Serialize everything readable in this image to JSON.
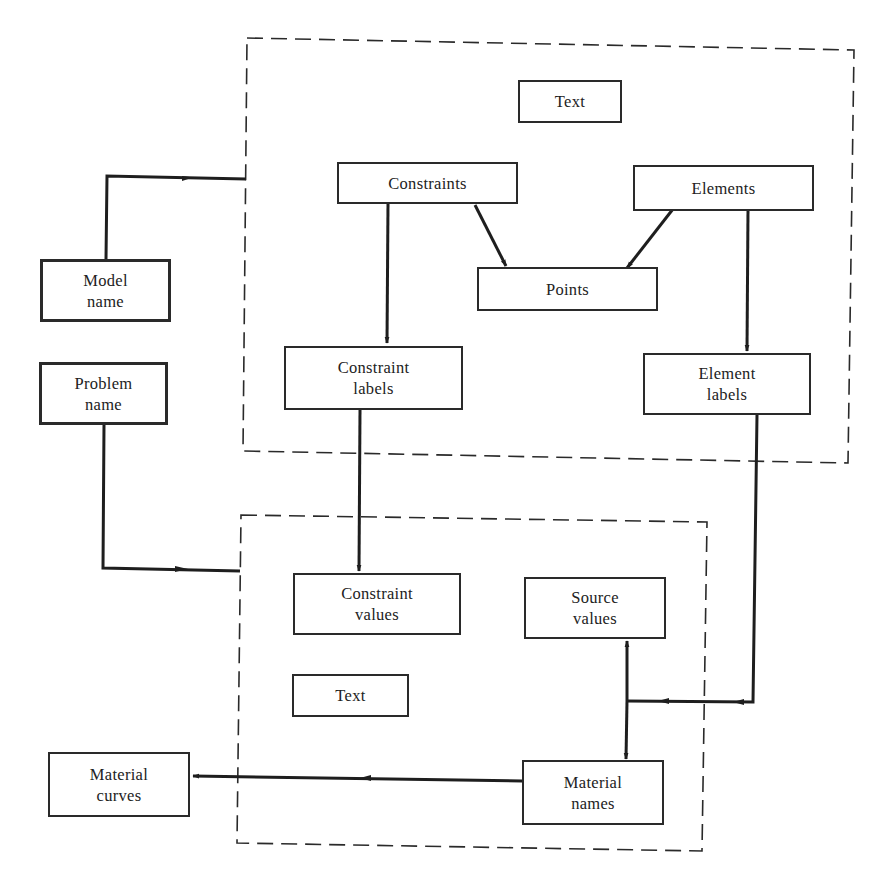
{
  "diagram": {
    "groups": [
      {
        "id": "upper-group",
        "style": "dashed"
      },
      {
        "id": "lower-group",
        "style": "dashed"
      }
    ],
    "nodes": {
      "text_upper": {
        "lines": [
          "Text"
        ]
      },
      "constraints": {
        "lines": [
          "Constraints"
        ]
      },
      "elements": {
        "lines": [
          "Elements"
        ]
      },
      "points": {
        "lines": [
          "Points"
        ]
      },
      "constraint_labels": {
        "lines": [
          "Constraint",
          "labels"
        ]
      },
      "element_labels": {
        "lines": [
          "Element",
          "labels"
        ]
      },
      "model_name": {
        "lines": [
          "Model",
          "name"
        ]
      },
      "problem_name": {
        "lines": [
          "Problem",
          "name"
        ]
      },
      "constraint_values": {
        "lines": [
          "Constraint",
          "values"
        ]
      },
      "text_lower": {
        "lines": [
          "Text"
        ]
      },
      "source_values": {
        "lines": [
          "Source",
          "values"
        ]
      },
      "material_names": {
        "lines": [
          "Material",
          "names"
        ]
      },
      "material_curves": {
        "lines": [
          "Material",
          "curves"
        ]
      }
    },
    "edges": [
      {
        "from": "Model name",
        "to": "upper-group"
      },
      {
        "from": "Problem name",
        "to": "lower-group"
      },
      {
        "from": "Constraints",
        "to": "Points"
      },
      {
        "from": "Elements",
        "to": "Points"
      },
      {
        "from": "Constraints",
        "to": "Constraint labels"
      },
      {
        "from": "Elements",
        "to": "Element labels"
      },
      {
        "from": "Constraint labels",
        "to": "Constraint values"
      },
      {
        "from": "Element labels",
        "to": "Source values / Material names junction"
      },
      {
        "from": "junction",
        "to": "Source values"
      },
      {
        "from": "junction",
        "to": "Material names"
      },
      {
        "from": "Material names",
        "to": "Material curves"
      }
    ]
  }
}
